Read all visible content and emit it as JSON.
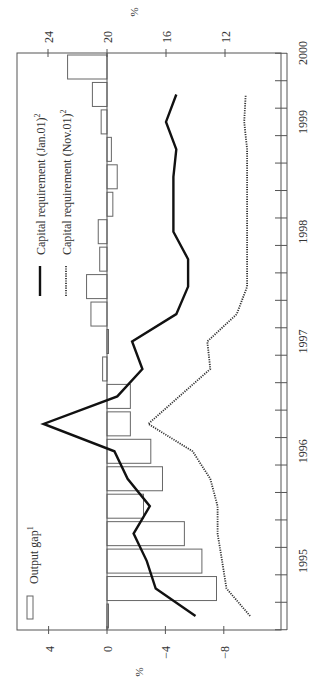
{
  "chart_data": {
    "type": "bar+line",
    "orientation": "rotated-90-clockwise",
    "title": "",
    "xlabel": "",
    "x_tick_labels": [
      "1995",
      "1996",
      "1997",
      "1998",
      "1999",
      "2000"
    ],
    "x_quarters_start": "1994Q3",
    "x_quarters_end": "1999Q4",
    "left_axis": {
      "label": "%",
      "ticks": [
        4,
        0,
        -4,
        -8
      ],
      "range": [
        6.1,
        -10.6
      ]
    },
    "right_axis": {
      "label": "%",
      "ticks": [
        24,
        20,
        16,
        12
      ],
      "range": [
        26.1,
        9.3
      ]
    },
    "legend": [
      {
        "label": "Output gap",
        "superscript": "1",
        "style": "bar-outline"
      },
      {
        "label": "Capital requirement (Jan.01)",
        "superscript": "2",
        "style": "solid"
      },
      {
        "label": "Capital requirement (Nov.01)",
        "superscript": "2",
        "style": "dotted"
      }
    ],
    "series": [
      {
        "name": "Output gap",
        "axis": "left",
        "type": "bar",
        "quarter_index": [
          0,
          1,
          2,
          3,
          4,
          5,
          6,
          7,
          8,
          9,
          10,
          11,
          12,
          13,
          14,
          15,
          16,
          17,
          18,
          19,
          20
        ],
        "values": [
          -0.1,
          -7.5,
          -6.5,
          -5.3,
          -2.5,
          -3.8,
          -3.0,
          -1.6,
          -1.6,
          0.3,
          -0.1,
          1.1,
          1.4,
          0.5,
          0.6,
          -0.4,
          -0.7,
          -0.3,
          0.4,
          1.0,
          2.7
        ]
      },
      {
        "name": "Capital requirement (Jan.01)",
        "axis": "right",
        "type": "line",
        "quarter_index": [
          0,
          1,
          2,
          3,
          4,
          5,
          6,
          7,
          8,
          9,
          10,
          11,
          12,
          13,
          14,
          15,
          16,
          17,
          18,
          19
        ],
        "values": [
          14.0,
          16.7,
          17.3,
          18.2,
          17.1,
          18.6,
          19.5,
          24.3,
          19.3,
          17.6,
          18.3,
          15.3,
          14.5,
          14.5,
          15.5,
          15.5,
          15.5,
          15.3,
          16.0,
          15.3
        ]
      },
      {
        "name": "Capital requirement (Nov.01)",
        "axis": "right",
        "type": "line",
        "quarter_index": [
          0,
          1,
          2,
          3,
          4,
          5,
          6,
          7,
          8,
          9,
          10,
          11,
          12,
          13,
          14,
          15,
          16,
          17,
          18,
          19
        ],
        "values": [
          10.3,
          11.9,
          12.2,
          12.5,
          12.5,
          13.0,
          14.2,
          17.2,
          15.1,
          13.0,
          13.2,
          11.2,
          10.5,
          10.5,
          10.5,
          10.5,
          10.5,
          10.5,
          10.7,
          10.6
        ]
      }
    ],
    "grid": false
  }
}
